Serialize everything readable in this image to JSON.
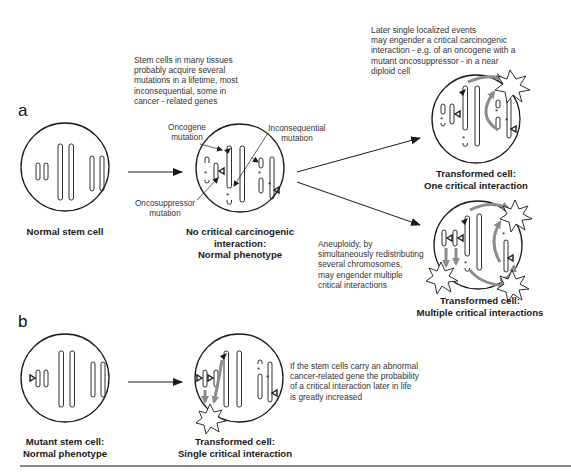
{
  "panels": {
    "a": {
      "letter": "a",
      "intro_note": "Stem cells in many tissues\nprobably acquire several\nmutations in a lifetime, most\ninconsequential, some in\ncancer - related genes",
      "normal_cell_label": "Normal stem cell",
      "middle_cell_label": "No critical carcinogenic\ninteraction:\nNormal phenotype",
      "annotations": {
        "oncogene": "Oncogene\nmutation",
        "inconsequential": "Inconsequential\nmutation",
        "oncosuppressor": "Oncosuppressor\nmutation"
      },
      "top_note": "Later single localized events\nmay engender a critical carcinogenic\ninteraction - e.g. of an oncogene with a\nmutant oncosuppressor - in a near\ndiploid cell",
      "top_cell_label": "Transformed cell:\nOne critical interaction",
      "aneuploidy_note": "Aneuploidy, by\nsimultaneously redistributing\nseveral chromosomes,\nmay engender multiple\ncritical interactions",
      "bottom_cell_label": "Transformed cell:\nMultiple critical interactions"
    },
    "b": {
      "letter": "b",
      "mutant_cell_label": "Mutant stem cell:\nNormal phenotype",
      "transformed_cell_label": "Transformed cell:\nSingle critical interaction",
      "note": "If the stem cells carry an abnormal\ncancer-related gene the probability\nof a critical interaction later in life\nis greatly increased"
    }
  },
  "colors": {
    "line": "#1a1a1a",
    "interaction_arrow": "#8c8c8c",
    "text": "#333333"
  }
}
